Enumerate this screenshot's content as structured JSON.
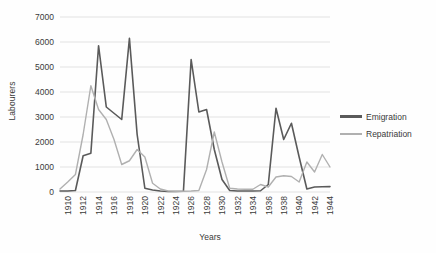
{
  "chart_data": {
    "type": "line",
    "title": "",
    "xlabel": "Years",
    "ylabel": "Labourers",
    "xlim": [
      1910,
      1945
    ],
    "ylim": [
      0,
      7000
    ],
    "ytick_step": 1000,
    "xtick_step": 2,
    "grid": true,
    "legend_position": "right",
    "ytick_labels": [
      "0",
      "1000",
      "2000",
      "3000",
      "4000",
      "5000",
      "6000",
      "7000"
    ],
    "ytick_values": [
      0,
      1000,
      2000,
      3000,
      4000,
      5000,
      6000,
      7000
    ],
    "xtick_labels": [
      "1910",
      "1912",
      "1914",
      "1916",
      "1918",
      "1920",
      "1922",
      "1924",
      "1926",
      "1928",
      "1930",
      "1932",
      "1934",
      "1936",
      "1938",
      "1940",
      "1942",
      "1944"
    ],
    "xtick_values": [
      1910,
      1912,
      1914,
      1916,
      1918,
      1920,
      1922,
      1924,
      1926,
      1928,
      1930,
      1932,
      1934,
      1936,
      1938,
      1940,
      1942,
      1944
    ],
    "x": [
      1910,
      1911,
      1912,
      1913,
      1914,
      1915,
      1916,
      1917,
      1918,
      1919,
      1920,
      1921,
      1922,
      1923,
      1924,
      1925,
      1926,
      1927,
      1928,
      1929,
      1930,
      1931,
      1932,
      1933,
      1934,
      1935,
      1936,
      1937,
      1938,
      1939,
      1940,
      1941,
      1942,
      1943,
      1944,
      1945
    ],
    "series": [
      {
        "name": "Emigration",
        "color": "#5a5a5a",
        "values": [
          40,
          40,
          60,
          1450,
          1550,
          5850,
          3400,
          3150,
          2900,
          6150,
          2300,
          150,
          80,
          40,
          20,
          20,
          30,
          5300,
          3200,
          3300,
          1700,
          500,
          60,
          40,
          40,
          40,
          50,
          300,
          3350,
          2100,
          2750,
          1400,
          120,
          200,
          210,
          215
        ]
      },
      {
        "name": "Repatriation",
        "color": "#b0b0b0",
        "values": [
          120,
          400,
          700,
          2300,
          4250,
          3300,
          2900,
          2100,
          1100,
          1250,
          1700,
          1400,
          350,
          120,
          40,
          30,
          30,
          40,
          60,
          900,
          2400,
          1200,
          150,
          120,
          110,
          110,
          300,
          200,
          600,
          650,
          620,
          400,
          1200,
          800,
          1500,
          1000
        ]
      }
    ]
  },
  "legend": {
    "items": [
      {
        "label": "Emigration"
      },
      {
        "label": "Repatriation"
      }
    ]
  },
  "axis_titles": {
    "x": "Years",
    "y": "Labourers"
  }
}
